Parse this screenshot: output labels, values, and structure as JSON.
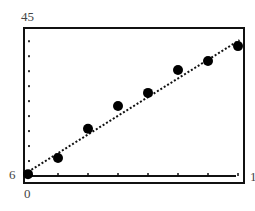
{
  "chart_data": {
    "type": "scatter",
    "title": "",
    "xlabel": "",
    "ylabel": "",
    "x_min_label": "0",
    "x_max_label": "1",
    "y_min_label": "6",
    "y_max_label": "45",
    "xlim": [
      0,
      7.2
    ],
    "ylim": [
      6,
      45
    ],
    "x_tick_step": 1,
    "y_tick_step": 4,
    "grid": false,
    "legend": null,
    "series": [
      {
        "name": "data",
        "marker": "filled-circle",
        "x": [
          0,
          1,
          2,
          3,
          4,
          5,
          6,
          7
        ],
        "y": [
          6.5,
          10.8,
          18.6,
          24.7,
          28.2,
          34.3,
          36.7,
          40.7
        ]
      },
      {
        "name": "fit-line",
        "style": "dotted",
        "x": [
          0,
          7.05
        ],
        "y": [
          7.1,
          42.3
        ]
      }
    ],
    "colors": {
      "frame": "#111111",
      "points": "#000000",
      "labels": "#444444"
    }
  }
}
